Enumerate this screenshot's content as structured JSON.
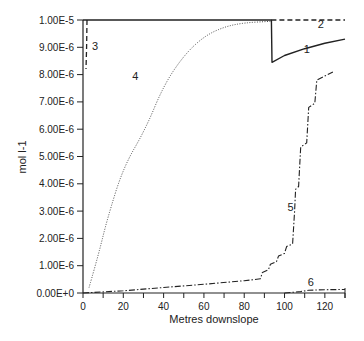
{
  "chart_data": {
    "type": "line",
    "title": "",
    "xlabel": "Metres downslope",
    "ylabel": "mol l-1",
    "xlim": [
      0,
      130
    ],
    "ylim": [
      0,
      1e-05
    ],
    "grid": false,
    "legend": "inline numeric labels",
    "x_ticks": [
      0,
      20,
      40,
      60,
      80,
      100,
      120
    ],
    "x_tick_labels": [
      "0",
      "20",
      "40",
      "60",
      "80",
      "100",
      "120"
    ],
    "y_ticks": [
      0,
      1e-06,
      2e-06,
      3e-06,
      4e-06,
      5e-06,
      6e-06,
      7e-06,
      8e-06,
      9e-06,
      1e-05
    ],
    "y_tick_labels": [
      "0.00E+0",
      "1.00E-6",
      "2.00E-6",
      "3.00E-6",
      "4.00E-6",
      "5.00E-6",
      "6.00E-6",
      "7.00E-6",
      "8.00E-6",
      "9.00E-6",
      "1.00E-5"
    ],
    "series": [
      {
        "name": "1",
        "style": "solid",
        "points": [
          [
            0,
            1e-05
          ],
          [
            93.5,
            1e-05
          ],
          [
            93.8,
            8.45e-06
          ],
          [
            100,
            8.7e-06
          ],
          [
            110,
            8.95e-06
          ],
          [
            120,
            9.15e-06
          ],
          [
            130,
            9.3e-06
          ]
        ]
      },
      {
        "name": "2",
        "style": "dashed",
        "points": [
          [
            93.5,
            1e-05
          ],
          [
            130,
            1e-05
          ]
        ]
      },
      {
        "name": "3",
        "style": "dashed",
        "points": [
          [
            2,
            1e-05
          ],
          [
            1.8,
            9e-06
          ],
          [
            1.5,
            8.2e-06
          ]
        ]
      },
      {
        "name": "4",
        "style": "dotted",
        "points": [
          [
            3,
            2e-07
          ],
          [
            8,
            1.5e-06
          ],
          [
            12,
            2.7e-06
          ],
          [
            20,
            4.6e-06
          ],
          [
            31,
            6e-06
          ],
          [
            40,
            7.6e-06
          ],
          [
            50,
            8.7e-06
          ],
          [
            60,
            9.4e-06
          ],
          [
            70,
            9.75e-06
          ],
          [
            80,
            9.9e-06
          ],
          [
            93,
            9.95e-06
          ]
        ]
      },
      {
        "name": "5",
        "style": "dash-dot",
        "points": [
          [
            0,
            0.0
          ],
          [
            20,
            8e-08
          ],
          [
            40,
            2e-07
          ],
          [
            60,
            3.2e-07
          ],
          [
            80,
            4.5e-07
          ],
          [
            88,
            5.2e-07
          ],
          [
            89,
            7.5e-07
          ],
          [
            92,
            8.5e-07
          ],
          [
            93,
            1.05e-06
          ],
          [
            96,
            1.15e-06
          ],
          [
            97,
            1.35e-06
          ],
          [
            100,
            1.45e-06
          ],
          [
            101,
            1.7e-06
          ],
          [
            104,
            1.8e-06
          ],
          [
            105,
            3e-06
          ],
          [
            105.5,
            3.8e-06
          ],
          [
            107,
            3.9e-06
          ],
          [
            108,
            5.35e-06
          ],
          [
            111,
            5.5e-06
          ],
          [
            112,
            6.8e-06
          ],
          [
            115,
            6.95e-06
          ],
          [
            116,
            7.8e-06
          ],
          [
            124,
            8.1e-06
          ]
        ]
      },
      {
        "name": "6",
        "style": "dash-dot",
        "points": [
          [
            100,
            0.0
          ],
          [
            108,
            5e-08
          ],
          [
            112,
            1e-07
          ],
          [
            120,
            1.2e-07
          ],
          [
            130,
            1.3e-07
          ]
        ]
      }
    ],
    "annotations": [
      {
        "text": "1",
        "x": 111,
        "y": 8.8e-06
      },
      {
        "text": "2",
        "x": 118,
        "y": 9.7e-06
      },
      {
        "text": "3",
        "x": 6,
        "y": 8.9e-06
      },
      {
        "text": "4",
        "x": 26,
        "y": 7.8e-06
      },
      {
        "text": "5",
        "x": 103,
        "y": 3e-06
      },
      {
        "text": "6",
        "x": 113,
        "y": 2.5e-07
      }
    ]
  }
}
